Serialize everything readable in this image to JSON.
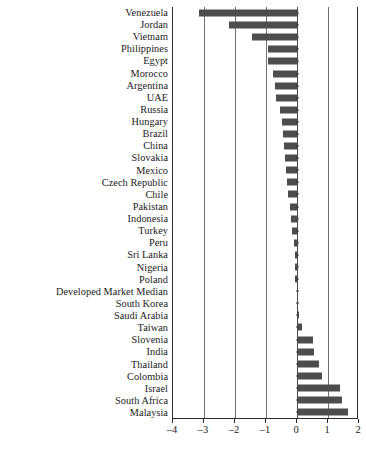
{
  "chart_data": {
    "type": "bar",
    "orientation": "horizontal",
    "title": "",
    "subtitle": "",
    "xlabel": "",
    "ylabel": "",
    "xlim": [
      -4,
      2
    ],
    "xticks": [
      -4,
      -3,
      -2,
      -1,
      0,
      1,
      2
    ],
    "xticklabels": [
      "-4",
      "-3",
      "-2",
      "-1",
      "0",
      "1",
      "2"
    ],
    "grid": true,
    "grid_axis": "x",
    "legend": "none",
    "bar_color": "#4d4d4d",
    "categories": [
      "Venezuela",
      "Jordan",
      "Vietnam",
      "Philippines",
      "Egypt",
      "Morocco",
      "Argentina",
      "UAE",
      "Russia",
      "Hungary",
      "Brazil",
      "China",
      "Slovakia",
      "Mexico",
      "Czech Republic",
      "Chile",
      "Pakistan",
      "Indonesia",
      "Turkey",
      "Peru",
      "Sri Lanka",
      "Nigeria",
      "Poland",
      "Developed Market Median",
      "South Korea",
      "Saudi Arabia",
      "Taiwan",
      "Slovenia",
      "India",
      "Thailand",
      "Colombia",
      "Israel",
      "South Africa",
      "Malaysia"
    ],
    "values": [
      -3.17,
      -2.2,
      -1.44,
      -0.95,
      -0.95,
      -0.77,
      -0.7,
      -0.68,
      -0.55,
      -0.5,
      -0.46,
      -0.42,
      -0.4,
      -0.35,
      -0.33,
      -0.3,
      -0.24,
      -0.2,
      -0.16,
      -0.1,
      -0.08,
      -0.06,
      -0.05,
      0.0,
      0.04,
      0.07,
      0.16,
      0.51,
      0.56,
      0.72,
      0.8,
      1.4,
      1.44,
      1.66
    ]
  }
}
